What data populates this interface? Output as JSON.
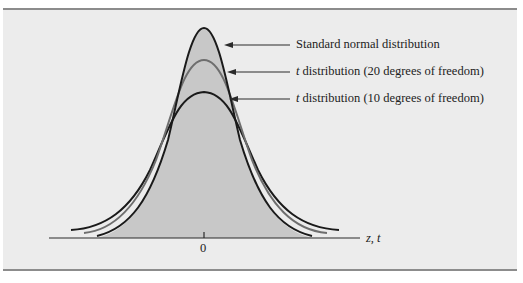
{
  "figure": {
    "labels": {
      "standard_normal": "Standard normal distribution",
      "t20_var": "t",
      "t20_rest": " distribution (20 degrees of freedom)",
      "t10_var": "t",
      "t10_rest": " distribution (10 degrees of freedom)"
    },
    "axis": {
      "tick_label": "0",
      "axis_label": "z, t"
    },
    "colors": {
      "panel_bg": "#ececec",
      "fill": "#c8c8c8",
      "rule": "#8c8c8c",
      "curve_dark": "#1a1a1a",
      "curve_gray": "#6e6e6e"
    }
  }
}
